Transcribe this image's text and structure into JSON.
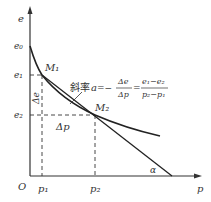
{
  "diagram": {
    "axes": {
      "y_label": "e",
      "x_label": "p",
      "origin": "O"
    },
    "y_ticks": [
      "e₀",
      "e₁",
      "e₂"
    ],
    "x_ticks": [
      "p₁",
      "p₂"
    ],
    "points": [
      "M₁",
      "M₂"
    ],
    "delta_e": "Δe",
    "delta_p": "Δp",
    "angle": "α",
    "slope_label": {
      "prefix": "斜率",
      "var": "a",
      "eq": "=−",
      "frac1_num": "Δe",
      "frac1_den": "Δp",
      "eq2": "=",
      "frac2_num": "e₁−e₂",
      "frac2_den": "p₂−p₁"
    }
  }
}
